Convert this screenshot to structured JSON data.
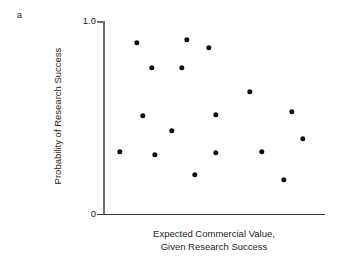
{
  "panel": {
    "label": "a"
  },
  "chart_data": {
    "type": "scatter",
    "title": "",
    "xlabel": "Expected Commercial Value, Given Research Success",
    "xlabel_lines": [
      "Expected Commercial Value,",
      "Given Research Success"
    ],
    "ylabel": "Probability of Research Success",
    "xlim": [
      0,
      1
    ],
    "ylim": [
      0,
      1
    ],
    "grid": false,
    "legend": null,
    "x_ticks": [],
    "x_tick_labels": [],
    "y_ticks": [
      0,
      1.0
    ],
    "y_tick_labels": [
      "0",
      "1.0"
    ],
    "marker": {
      "shape": "circle",
      "color": "#0d0d0d",
      "size_px": 5.4
    },
    "points": [
      {
        "x": 0.153,
        "y": 0.886
      },
      {
        "x": 0.221,
        "y": 0.756
      },
      {
        "x": 0.378,
        "y": 0.902
      },
      {
        "x": 0.356,
        "y": 0.756
      },
      {
        "x": 0.477,
        "y": 0.86
      },
      {
        "x": 0.662,
        "y": 0.632
      },
      {
        "x": 0.18,
        "y": 0.508
      },
      {
        "x": 0.311,
        "y": 0.43
      },
      {
        "x": 0.509,
        "y": 0.513
      },
      {
        "x": 0.851,
        "y": 0.528
      },
      {
        "x": 0.077,
        "y": 0.321
      },
      {
        "x": 0.234,
        "y": 0.306
      },
      {
        "x": 0.509,
        "y": 0.316
      },
      {
        "x": 0.716,
        "y": 0.321
      },
      {
        "x": 0.901,
        "y": 0.389
      },
      {
        "x": 0.414,
        "y": 0.202
      },
      {
        "x": 0.815,
        "y": 0.176
      }
    ]
  },
  "axes": {
    "y_axis_color": "#6f6f6f",
    "x_axis_color": "#3a3a3a"
  }
}
